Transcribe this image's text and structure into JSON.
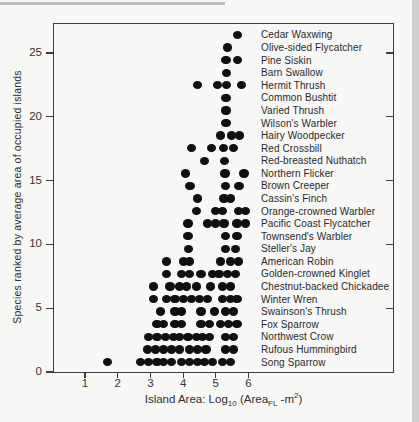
{
  "figure": {
    "ylabel": "Species ranked by average area of occupied islands",
    "xlabel": {
      "p1": "Island Area: Log",
      "sub1": "10",
      "p2": " (Area",
      "sub2": "FL",
      "p3": " -m",
      "sup1": "2",
      "p4": ")"
    }
  },
  "chart_data": {
    "type": "scatter",
    "title": "",
    "xlabel": "Island Area: Log10 (AreaFL -m2)",
    "ylabel": "Species ranked by average area of occupied islands",
    "xlim": [
      0,
      10.4
    ],
    "ylim": [
      0,
      27.4
    ],
    "x_ticks": [
      1,
      2,
      3,
      4,
      5,
      6
    ],
    "y_ticks": [
      0,
      5,
      10,
      15,
      20,
      25
    ],
    "right_edge_ticks": [
      5,
      10,
      15,
      20,
      25
    ],
    "grid": false,
    "legend_position": "none",
    "dot_color": "#101010",
    "series": [
      {
        "name": "Cedar Waxwing",
        "rank": 27,
        "x": [
          5.67
        ]
      },
      {
        "name": "Olive-sided Flycatcher",
        "rank": 26,
        "x": [
          5.35
        ]
      },
      {
        "name": "Pine Siskin",
        "rank": 25,
        "x": [
          5.31,
          5.67
        ]
      },
      {
        "name": "Barn Swallow",
        "rank": 24,
        "x": [
          5.33
        ]
      },
      {
        "name": "Hermit Thrush",
        "rank": 23,
        "x": [
          4.45,
          5.05,
          5.33,
          5.79
        ]
      },
      {
        "name": "Common Bushtit",
        "rank": 22,
        "x": [
          5.31
        ]
      },
      {
        "name": "Varied Thrush",
        "rank": 21,
        "x": [
          5.31
        ]
      },
      {
        "name": "Wilson's Warbler",
        "rank": 20,
        "x": [
          5.31
        ]
      },
      {
        "name": "Hairy Woodpecker",
        "rank": 19,
        "x": [
          5.15,
          5.49,
          5.72
        ]
      },
      {
        "name": "Red Crossbill",
        "rank": 18,
        "x": [
          4.26,
          4.88,
          5.23,
          5.54
        ]
      },
      {
        "name": "Red-breasted Nuthatch",
        "rank": 17,
        "x": [
          4.65,
          5.26
        ]
      },
      {
        "name": "Northern Flicker",
        "rank": 16,
        "x": [
          4.08,
          5.28,
          5.86
        ]
      },
      {
        "name": "Brown Creeper",
        "rank": 15,
        "x": [
          4.21,
          5.3,
          5.71
        ]
      },
      {
        "name": "Cassin's Finch",
        "rank": 14,
        "x": [
          4.45,
          5.25,
          5.45
        ]
      },
      {
        "name": "Orange-crowned Warbler",
        "rank": 13,
        "x": [
          4.4,
          5.0,
          5.2,
          5.7,
          5.9
        ]
      },
      {
        "name": "Pacific Coast Flycatcher",
        "rank": 12,
        "x": [
          4.15,
          4.75,
          5.0,
          5.25,
          5.65,
          5.9
        ]
      },
      {
        "name": "Townsend's Warbler",
        "rank": 11,
        "x": [
          4.15,
          5.3,
          5.65
        ]
      },
      {
        "name": "Steller's Jay",
        "rank": 10,
        "x": [
          4.17,
          5.29,
          5.6
        ]
      },
      {
        "name": "American Robin",
        "rank": 9,
        "x": [
          3.5,
          4.0,
          4.2,
          5.15,
          5.45,
          5.7
        ]
      },
      {
        "name": "Golden-crowned Kinglet",
        "rank": 8,
        "x": [
          3.5,
          3.95,
          4.2,
          4.55,
          4.9,
          5.1,
          5.35,
          5.6
        ]
      },
      {
        "name": "Chestnut-backed Chickadee",
        "rank": 7,
        "x": [
          3.1,
          3.6,
          3.9,
          4.1,
          4.4,
          4.85,
          5.2,
          5.45
        ]
      },
      {
        "name": "Winter Wren",
        "rank": 6,
        "x": [
          3.1,
          3.5,
          3.75,
          4.0,
          4.25,
          4.5,
          4.75,
          5.2,
          5.45,
          5.65
        ]
      },
      {
        "name": "Swainson's Thrush",
        "rank": 5,
        "x": [
          3.3,
          3.75,
          3.95,
          4.55,
          4.95,
          5.3,
          5.55
        ]
      },
      {
        "name": "Fox Sparrow",
        "rank": 4,
        "x": [
          3.2,
          3.4,
          3.75,
          3.95,
          4.55,
          4.8,
          5.15,
          5.4,
          5.65
        ]
      },
      {
        "name": "Northwest Crow",
        "rank": 3,
        "x": [
          2.95,
          3.2,
          3.45,
          3.7,
          3.9,
          4.15,
          4.4,
          4.6,
          4.8,
          5.3,
          5.55
        ]
      },
      {
        "name": "Rufous Hummingbird",
        "rank": 2,
        "x": [
          2.9,
          3.15,
          3.4,
          3.65,
          3.9,
          4.2,
          4.45,
          4.7,
          5.3,
          5.55
        ]
      },
      {
        "name": "Song Sparrow",
        "rank": 1,
        "x": [
          1.7,
          2.7,
          2.95,
          3.2,
          3.4,
          3.65,
          3.95,
          4.2,
          4.45,
          4.65,
          4.9,
          5.2,
          5.45
        ]
      }
    ]
  }
}
